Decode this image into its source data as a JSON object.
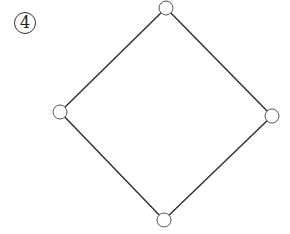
{
  "diagram": {
    "label": "4",
    "type": "graph",
    "nodes": [
      {
        "id": "top",
        "x": 166,
        "y": 8
      },
      {
        "id": "left",
        "x": 60,
        "y": 112
      },
      {
        "id": "right",
        "x": 272,
        "y": 116
      },
      {
        "id": "bottom",
        "x": 164,
        "y": 220
      }
    ],
    "edges": [
      [
        "top",
        "right"
      ],
      [
        "right",
        "bottom"
      ],
      [
        "bottom",
        "left"
      ],
      [
        "left",
        "top"
      ]
    ],
    "stroke_color": "#333333",
    "node_fill": "#ffffff"
  }
}
